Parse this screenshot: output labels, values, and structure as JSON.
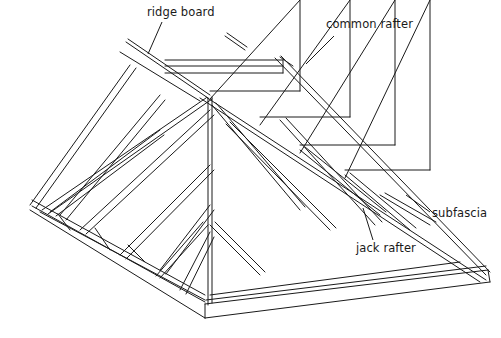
{
  "diagram": {
    "stroke_color": "#1a1a1a",
    "background_color": "#ffffff",
    "labels": [
      {
        "id": "ridge-board",
        "text": "ridge board",
        "x": 147,
        "y": 5,
        "leader": [
          [
            162,
            22
          ],
          [
            148,
            54
          ]
        ]
      },
      {
        "id": "common-rafter",
        "text": "common rafter",
        "x": 326,
        "y": 17,
        "leader": [
          [
            334,
            36
          ],
          [
            306,
            64
          ]
        ]
      },
      {
        "id": "subfascia",
        "text": "subfascia",
        "x": 432,
        "y": 206,
        "leader": [
          [
            430,
            212
          ],
          [
            406,
            195
          ]
        ]
      },
      {
        "id": "jack-rafter",
        "text": "jack rafter",
        "x": 356,
        "y": 241,
        "leader": [
          [
            373,
            240
          ],
          [
            363,
            208
          ]
        ]
      }
    ]
  }
}
